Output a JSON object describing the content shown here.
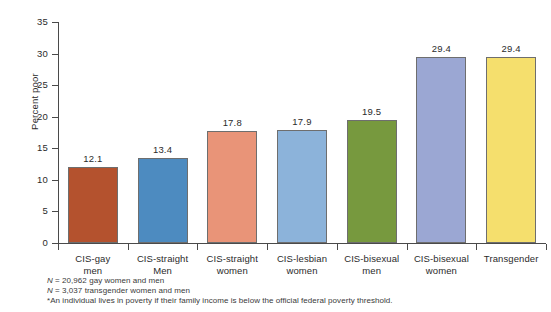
{
  "chart_data": {
    "type": "bar",
    "title": "",
    "xlabel": "",
    "ylabel": "Percent poor",
    "ylim": [
      0,
      35
    ],
    "yticks": [
      0,
      5,
      10,
      15,
      20,
      25,
      30,
      35
    ],
    "grid": false,
    "legend": "none",
    "categories": [
      "CIS-gay\nmen",
      "CIS-straight\nMen",
      "CIS-straight\nwomen",
      "CIS-lesbian\nwomen",
      "CIS-bisexual\nmen",
      "CIS-bisexual\nwomen",
      "Transgender"
    ],
    "values": [
      12.1,
      13.4,
      17.8,
      17.9,
      19.5,
      29.4,
      29.4
    ],
    "value_labels": [
      "12.1",
      "13.4",
      "17.8",
      "17.9",
      "19.5",
      "29.4",
      "29.4"
    ],
    "bar_colors": [
      "#b4522e",
      "#4d8bc0",
      "#e99478",
      "#8cb3da",
      "#77993e",
      "#9ba7d3",
      "#f5df6d"
    ],
    "bar_edge_color": "#6e6e6e"
  },
  "notes": {
    "line1_prefix": "N",
    "line1": " = 20,962 gay women and men",
    "line2_prefix": "N",
    "line2": " = 3,037 transgender women and men",
    "line3": "*An individual lives in poverty if their family income is below the official federal poverty threshold."
  }
}
